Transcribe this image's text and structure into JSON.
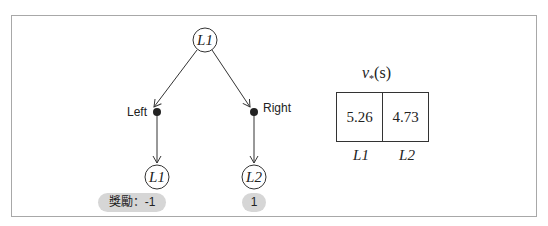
{
  "tree": {
    "root": {
      "label": "L1"
    },
    "actions": [
      {
        "label": "Left"
      },
      {
        "label": "Right"
      }
    ],
    "children": [
      {
        "label": "L1",
        "reward": "獎勵：-1"
      },
      {
        "label": "L2",
        "reward": "1"
      }
    ]
  },
  "value_table": {
    "title_symbol": "v",
    "title_subscript": "*",
    "title_arg": "(s)",
    "cells": [
      "5.26",
      "4.73"
    ],
    "columns": [
      "L1",
      "L2"
    ]
  },
  "colors": {
    "line": "#333333",
    "pill_bg": "#d6d6d6",
    "frame": "#a8a8a8"
  }
}
